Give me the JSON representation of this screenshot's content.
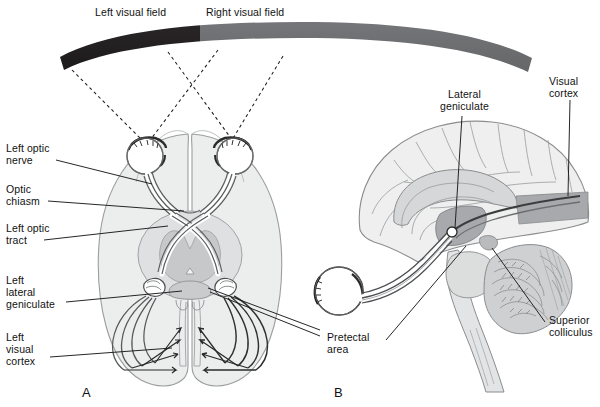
{
  "figure": {
    "panels": [
      {
        "id": "A",
        "letter": "A",
        "caption": "Horizontal section of the brain showing the visual pathway from the eyes"
      },
      {
        "id": "B",
        "letter": "B",
        "caption": "Midsagittal view of the brain showing the visual pathway"
      }
    ]
  },
  "field_bar": {
    "left_label": "Left visual field",
    "right_label": "Right visual field",
    "left_color": "#231f20",
    "right_color": "#6d6e70"
  },
  "labels_panel_a": [
    {
      "id": "left-optic-nerve",
      "text": "Left optic\nnerve",
      "x": 6,
      "y": 142
    },
    {
      "id": "optic-chiasm",
      "text": "Optic\nchiasm",
      "x": 6,
      "y": 183
    },
    {
      "id": "left-optic-tract",
      "text": "Left optic\ntract",
      "x": 6,
      "y": 222
    },
    {
      "id": "left-lateral-geniculate",
      "text": "Left\nlateral\ngeniculate",
      "x": 6,
      "y": 274
    },
    {
      "id": "left-visual-cortex",
      "text": "Left\nvisual\ncortex",
      "x": 6,
      "y": 331
    }
  ],
  "labels_panel_b": [
    {
      "id": "lateral-geniculate",
      "text": "Lateral\ngeniculate",
      "x": 440,
      "y": 88
    },
    {
      "id": "visual-cortex",
      "text": "Visual\ncortex",
      "x": 549,
      "y": 75
    },
    {
      "id": "pretectal-area",
      "text": "Pretectal\narea",
      "x": 327,
      "y": 331
    },
    {
      "id": "superior-colliculus",
      "text": "Superior\ncolliculus",
      "x": 549,
      "y": 314
    }
  ],
  "panel_letters": [
    {
      "id": "panel-a-letter",
      "text": "A",
      "x": 82,
      "y": 385
    },
    {
      "id": "panel-b-letter",
      "text": "B",
      "x": 334,
      "y": 385
    }
  ],
  "colors": {
    "brain_fill": "#eceded",
    "brain_stroke": "#8a8c8e",
    "midbrain_fill": "#d7d8d9",
    "thalamus_fill": "#c3c5c6",
    "tract_stroke": "#58595b",
    "highlight_gray": "#a7a9ac",
    "dashed_line": "#1a1a1a",
    "leader_line": "#1a1a1a",
    "page_background": "#ffffff"
  }
}
